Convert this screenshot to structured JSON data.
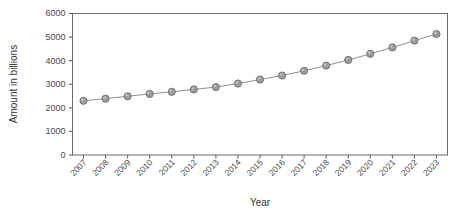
{
  "chart_data": {
    "type": "line",
    "title": "",
    "xlabel": "Year",
    "ylabel": "Amount in billions",
    "categories": [
      "2007",
      "2008",
      "2009",
      "2010",
      "2011",
      "2012",
      "2013",
      "2014",
      "2015",
      "2016",
      "2017",
      "2018",
      "2019",
      "2020",
      "2021",
      "2022",
      "2023"
    ],
    "values": [
      2300,
      2390,
      2490,
      2590,
      2680,
      2780,
      2880,
      3030,
      3200,
      3370,
      3570,
      3790,
      4030,
      4290,
      4560,
      4850,
      5130
    ],
    "series": [
      {
        "name": "Amount in billions",
        "values": [
          2300,
          2390,
          2490,
          2590,
          2680,
          2780,
          2880,
          3030,
          3200,
          3370,
          3570,
          3790,
          4030,
          4290,
          4560,
          4850,
          5130
        ]
      }
    ],
    "ylim": [
      0,
      6000
    ],
    "yticks": [
      0,
      1000,
      2000,
      3000,
      4000,
      5000,
      6000
    ],
    "ytick_labels": [
      "0",
      "1000",
      "2000",
      "3000",
      "4000",
      "5000",
      "6000"
    ],
    "grid": false,
    "legend": false,
    "legend_position": "none",
    "marker": "circle",
    "marker_color": "#9d9d9d",
    "line_color": "#8f8f8f",
    "background_color": "#ffffff",
    "frame_color": "#6b6b6b",
    "xtick_rotation": 45
  }
}
